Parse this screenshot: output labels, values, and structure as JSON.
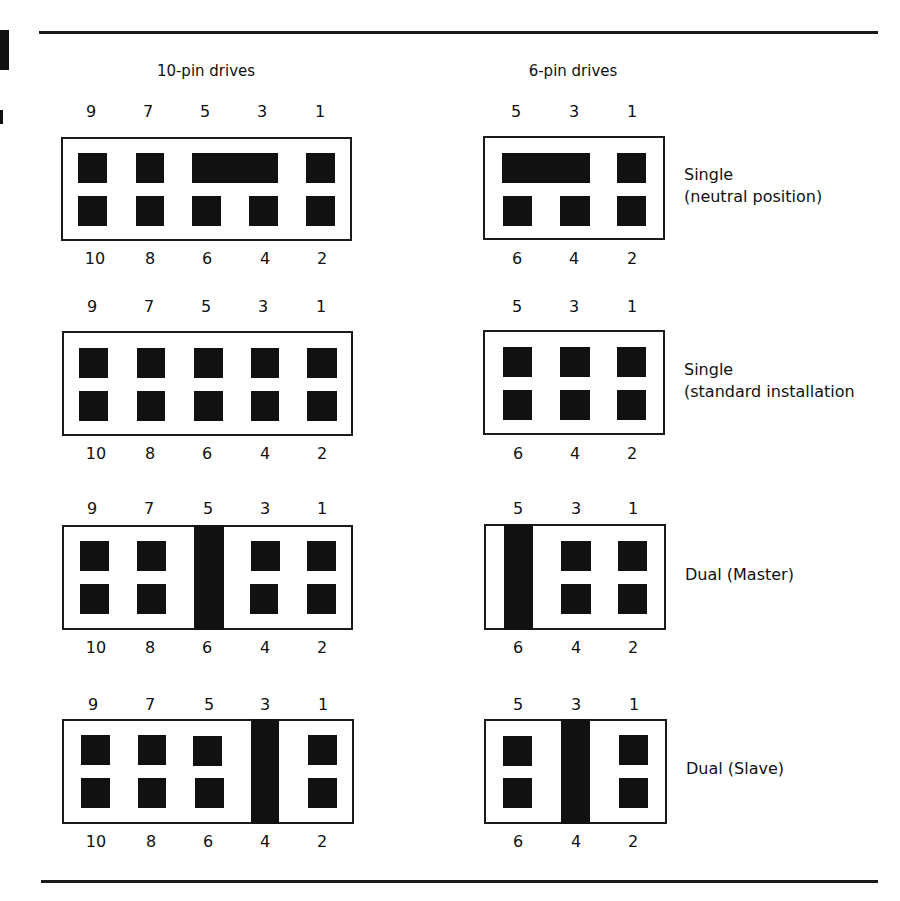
{
  "headers": {
    "ten_pin": "10-pin drives",
    "six_pin": "6-pin drives"
  },
  "ten_pin": {
    "top_numbers": [
      "9",
      "7",
      "5",
      "3",
      "1"
    ],
    "bottom_numbers": [
      "10",
      "8",
      "6",
      "4",
      "2"
    ]
  },
  "six_pin": {
    "top_numbers": [
      "5",
      "3",
      "1"
    ],
    "bottom_numbers": [
      "6",
      "4",
      "2"
    ]
  },
  "configurations": [
    {
      "label_line1": "Single",
      "label_line2": "(neutral position)",
      "ten_pin_jumper": "horizontal bridging pins 5 and 3",
      "six_pin_jumper": "horizontal bridging pins 5 and 3"
    },
    {
      "label_line1": "Single",
      "label_line2": "(standard installation",
      "ten_pin_jumper": "none",
      "six_pin_jumper": "none"
    },
    {
      "label_line1": "Dual (Master)",
      "label_line2": "",
      "ten_pin_jumper": "vertical bridging pins 5 and 6",
      "six_pin_jumper": "vertical bridging pins 5 and 6"
    },
    {
      "label_line1": "Dual (Slave)",
      "label_line2": "",
      "ten_pin_jumper": "vertical bridging pins 3 and 4",
      "six_pin_jumper": "vertical bridging pins 3 and 4"
    }
  ]
}
